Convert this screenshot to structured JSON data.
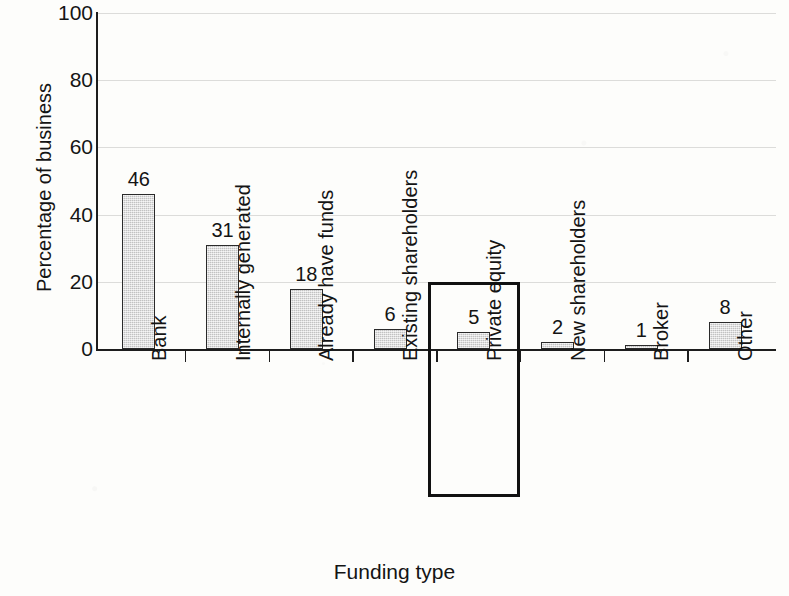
{
  "chart_data": {
    "type": "bar",
    "title": "",
    "xlabel": "Funding type",
    "ylabel": "Percentage of business",
    "categories": [
      "Bank",
      "Internally generated",
      "Already have funds",
      "Existing shareholders",
      "Private equity",
      "New shareholders",
      "Broker",
      "Other"
    ],
    "values": [
      46,
      31,
      18,
      6,
      5,
      2,
      1,
      8
    ],
    "data_labels": [
      "46",
      "31",
      "18",
      "6",
      "5",
      "2",
      "1",
      "8"
    ],
    "ylim": [
      0,
      100
    ],
    "yticks": [
      0,
      20,
      40,
      60,
      80,
      100
    ],
    "ytick_labels": [
      "0",
      "20",
      "40",
      "60",
      "80",
      "100"
    ],
    "grid": true,
    "legend": "none",
    "highlighted_category": "Private equity",
    "bar_fill_color": "#d4d4d4",
    "bar_edge_color": "#2a2a2a",
    "highlight_color": "#111111",
    "axis_color": "#1d1d1d",
    "background_color": "#fdfdfb"
  }
}
